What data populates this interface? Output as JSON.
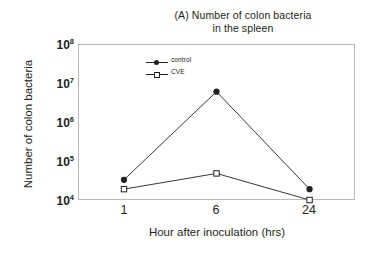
{
  "chart_data": {
    "type": "line",
    "title": "(A) Number of colon bacteria in the spleen",
    "title_lines": [
      "(A) Number of colon bacteria",
      "in the spleen"
    ],
    "xlabel": "Hour after inoculation (hrs)",
    "ylabel": "Number of colon bacteria",
    "x": [
      1,
      6,
      24
    ],
    "categories": [
      "1",
      "6",
      "24"
    ],
    "xtick_labels": [
      "1",
      "6",
      "24"
    ],
    "yscale": "log",
    "ylim": [
      10000,
      100000000
    ],
    "ytick_labels": [
      "10⁸",
      "10⁷",
      "10⁶",
      "10⁵",
      "10⁴"
    ],
    "ytick_mantissas": [
      "10",
      "10",
      "10",
      "10",
      "10"
    ],
    "ytick_exponents": [
      "8",
      "7",
      "6",
      "5",
      "4"
    ],
    "ytick_values": [
      100000000,
      10000000,
      1000000,
      100000,
      10000
    ],
    "grid": false,
    "legend_position": "upper-left-inside",
    "series": [
      {
        "name": "control",
        "marker": "filled-circle",
        "color": "#231f20",
        "values": [
          33000,
          6000000,
          19000
        ]
      },
      {
        "name": "CVE",
        "marker": "open-square",
        "color": "#231f20",
        "values": [
          19000,
          48000,
          10000
        ]
      }
    ]
  },
  "legend": {
    "items": [
      {
        "label": "control",
        "marker": "filled-circle"
      },
      {
        "label": "CVE",
        "marker": "open-square"
      }
    ]
  },
  "axes": {
    "x_title": "Hour after inoculation (hrs)",
    "y_title": "Number of colon bacteria"
  }
}
